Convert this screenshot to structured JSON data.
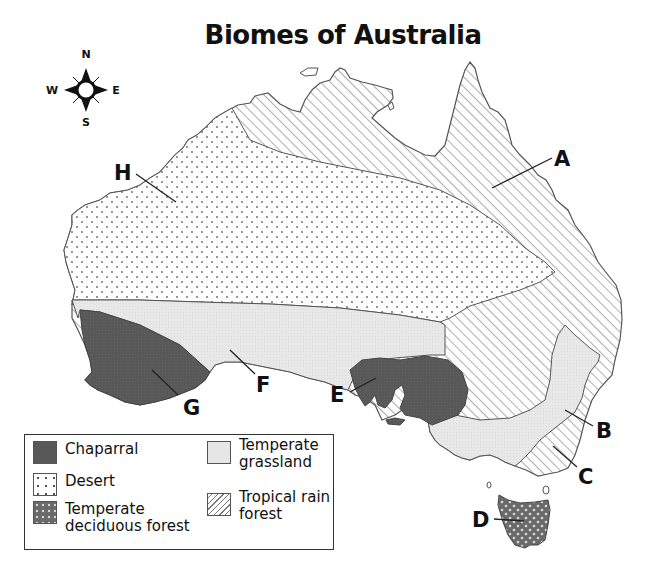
{
  "title": "Biomes of Australia",
  "compass": {
    "north": "N",
    "south": "S",
    "east": "E",
    "west": "W"
  },
  "colors": {
    "chaparral": "#595959",
    "temperate_grassland": "#e6e6e6",
    "desert": "#ffffff",
    "temperate_deciduous_forest": "#707070",
    "tropical_rain_forest": "#ffffff",
    "outline": "#555555"
  },
  "map_labels": [
    {
      "id": "A",
      "text": "A",
      "biome": "Tropical rain forest"
    },
    {
      "id": "B",
      "text": "B",
      "biome": "Temperate grassland"
    },
    {
      "id": "C",
      "text": "C",
      "biome": "Tropical rain forest"
    },
    {
      "id": "D",
      "text": "D",
      "biome": "Temperate deciduous forest"
    },
    {
      "id": "E",
      "text": "E",
      "biome": "Chaparral"
    },
    {
      "id": "F",
      "text": "F",
      "biome": "Temperate grassland"
    },
    {
      "id": "G",
      "text": "G",
      "biome": "Chaparral"
    },
    {
      "id": "H",
      "text": "H",
      "biome": "Desert"
    }
  ],
  "legend": {
    "items": [
      {
        "key": "chaparral",
        "label_line1": "Chaparral",
        "label_line2": ""
      },
      {
        "key": "desert",
        "label_line1": "Desert",
        "label_line2": ""
      },
      {
        "key": "temperate_deciduous_forest",
        "label_line1": "Temperate",
        "label_line2": "deciduous forest"
      },
      {
        "key": "temperate_grassland",
        "label_line1": "Temperate",
        "label_line2": "grassland"
      },
      {
        "key": "tropical_rain_forest",
        "label_line1": "Tropical rain",
        "label_line2": "forest"
      }
    ]
  }
}
